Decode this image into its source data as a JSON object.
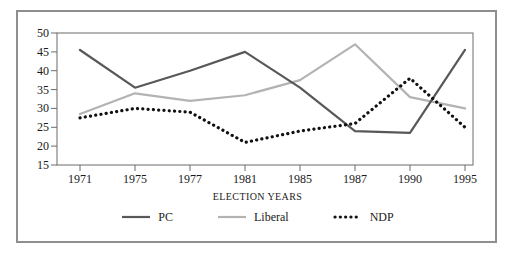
{
  "chart_data": {
    "type": "line",
    "title": "",
    "xlabel": "ELECTION YEARS",
    "ylabel": "",
    "categories": [
      "1971",
      "1975",
      "1977",
      "1981",
      "1985",
      "1987",
      "1990",
      "1995"
    ],
    "yticks": [
      "50",
      "45",
      "40",
      "35",
      "30",
      "25",
      "20",
      "15"
    ],
    "ylim": [
      15,
      50
    ],
    "grid": false,
    "legend_position": "bottom",
    "series": [
      {
        "name": "PC",
        "color": "#585858",
        "style": "solid",
        "values": [
          45.5,
          35.5,
          40.0,
          45.0,
          35.5,
          24.0,
          23.5,
          45.5
        ]
      },
      {
        "name": "Liberal",
        "color": "#b3b3b3",
        "style": "solid",
        "values": [
          28.5,
          34.0,
          32.0,
          33.5,
          37.5,
          47.0,
          33.0,
          30.0
        ]
      },
      {
        "name": "NDP",
        "color": "#111111",
        "style": "dotted",
        "values": [
          27.5,
          30.0,
          29.0,
          21.0,
          24.0,
          26.0,
          38.0,
          25.0
        ]
      }
    ]
  },
  "axes": {
    "ytick_labels": [
      "50",
      "45",
      "40",
      "35",
      "30",
      "25",
      "20",
      "15"
    ],
    "xtick_labels": [
      "1971",
      "1975",
      "1977",
      "1981",
      "1985",
      "1987",
      "1990",
      "1995"
    ],
    "xaxis_title": "ELECTION YEARS"
  },
  "legend": {
    "items": [
      {
        "label": "PC",
        "color": "#585858",
        "style": "solid"
      },
      {
        "label": "Liberal",
        "color": "#b3b3b3",
        "style": "solid"
      },
      {
        "label": "NDP",
        "color": "#111111",
        "style": "dotted"
      }
    ]
  },
  "colors": {
    "frame": "#8f8f8f",
    "axis": "#6b6b6b",
    "background": "#ffffff",
    "text": "#1a1a1a"
  }
}
